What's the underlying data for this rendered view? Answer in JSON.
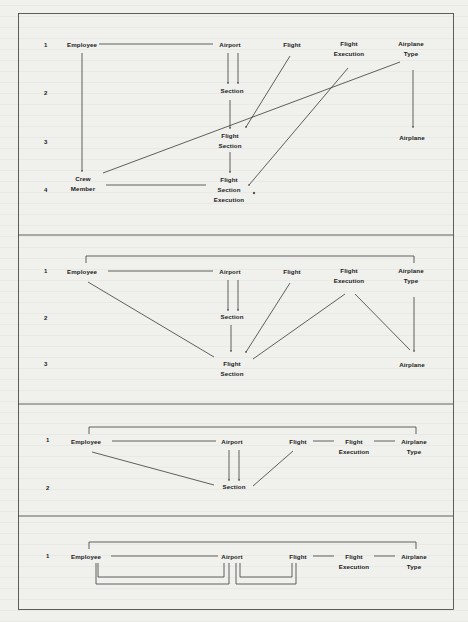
{
  "figure": {
    "panels": [
      {
        "id": "panel-1",
        "row_numbers": [
          "1",
          "2",
          "3",
          "4"
        ],
        "entities": {
          "employee": "Employee",
          "airport": "Airport",
          "flight": "Flight",
          "flight_execution": [
            "Flight",
            "Execution"
          ],
          "airplane_type": [
            "Airplane",
            "Type"
          ],
          "section": "Section",
          "flight_section": [
            "Flight",
            "Section"
          ],
          "airplane": "Airplane",
          "crew_member": [
            "Crew",
            "Member"
          ],
          "flight_section_execution": [
            "Flight",
            "Section",
            "Execution"
          ]
        }
      },
      {
        "id": "panel-2",
        "row_numbers": [
          "1",
          "2",
          "3"
        ],
        "entities": {
          "employee": "Employee",
          "airport": "Airport",
          "flight": "Flight",
          "flight_execution": [
            "Flight",
            "Execution"
          ],
          "airplane_type": [
            "Airplane",
            "Type"
          ],
          "section": "Section",
          "flight_section": [
            "Flight",
            "Section"
          ],
          "airplane": "Airplane"
        }
      },
      {
        "id": "panel-3",
        "row_numbers": [
          "1",
          "2"
        ],
        "entities": {
          "employee": "Employee",
          "airport": "Airport",
          "flight": "Flight",
          "flight_execution": [
            "Flight",
            "Execution"
          ],
          "airplane_type": [
            "Airplane",
            "Type"
          ],
          "section": "Section"
        }
      },
      {
        "id": "panel-4",
        "row_numbers": [
          "1"
        ],
        "entities": {
          "employee": "Employee",
          "airport": "Airport",
          "flight": "Flight",
          "flight_execution": [
            "Flight",
            "Execution"
          ],
          "airplane_type": [
            "Airplane",
            "Type"
          ]
        }
      }
    ],
    "colors": {
      "line": "#3a3a3a",
      "paper": "#f0f0ed",
      "text": "#1a1a1a"
    }
  }
}
